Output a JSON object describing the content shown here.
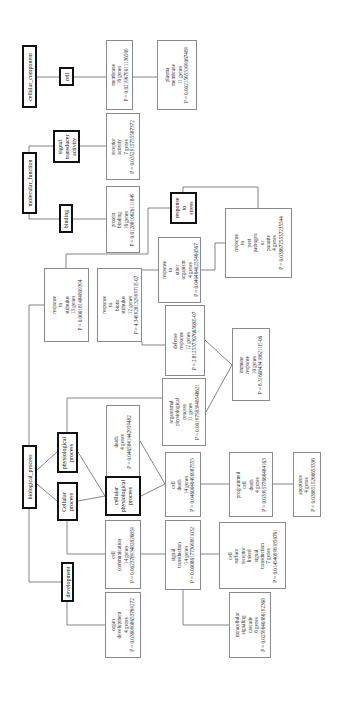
{
  "diagram": {
    "type": "GO term enrichment tree",
    "orientation": "rotated -90deg",
    "nodes": [
      {
        "id": "cellular_component",
        "lines": [
          "cellular_component"
        ],
        "thick": true,
        "box": [
          22,
          45,
          15,
          63
        ]
      },
      {
        "id": "cell",
        "lines": [
          "cell"
        ],
        "thick": true,
        "box": [
          59,
          67,
          15,
          19
        ]
      },
      {
        "id": "membrane",
        "lines": [
          "membrane",
          "16 genes",
          "P = 0.0219679011136509"
        ],
        "thick": false,
        "box": [
          106,
          40,
          27,
          70
        ]
      },
      {
        "id": "plasma_membrane",
        "lines": [
          "plasma",
          "membrane",
          "11 genes",
          "P = 0.00215655169067489"
        ],
        "thick": false,
        "box": [
          157,
          40,
          40,
          70
        ]
      },
      {
        "id": "molecular_function",
        "lines": [
          "molecular_function"
        ],
        "thick": true,
        "box": [
          22,
          152,
          15,
          62
        ]
      },
      {
        "id": "signal_transducer_activity",
        "lines": [
          "signal",
          "transducer",
          "activity"
        ],
        "thick": true,
        "box": [
          53,
          130,
          27,
          33
        ]
      },
      {
        "id": "receptor_activity",
        "lines": [
          "receptor",
          "activity",
          "7 genes",
          "P = 0.0352915755587372"
        ],
        "thick": false,
        "box": [
          106,
          113,
          34,
          67
        ]
      },
      {
        "id": "binding",
        "lines": [
          "binding"
        ],
        "thick": true,
        "box": [
          59,
          204,
          14,
          29
        ]
      },
      {
        "id": "protein_binding",
        "lines": [
          "protein",
          "binding",
          "16 genes",
          "P = 0.0128810620111849"
        ],
        "thick": false,
        "box": [
          106,
          186,
          34,
          67
        ]
      },
      {
        "id": "response_to_stress",
        "lines": [
          "response",
          "to",
          "stress"
        ],
        "thick": true,
        "box": [
          170,
          192,
          27,
          32
        ]
      },
      {
        "id": "response_to_pest",
        "lines": [
          "response",
          "to",
          "pest",
          "pathogen",
          "or",
          "parasite",
          "4 genes",
          "P = 0.0386725537235544"
        ],
        "thick": false,
        "box": [
          225,
          208,
          67,
          70
        ]
      },
      {
        "id": "response_to_other_organism",
        "lines": [
          "response",
          "to",
          "other",
          "organism",
          "4 genes",
          "P = 0.0404640255460567"
        ],
        "thick": false,
        "box": [
          158,
          237,
          43,
          66
        ]
      },
      {
        "id": "response_to_stimulus",
        "lines": [
          "response",
          "to",
          "stimulus",
          "13 genes",
          "P = 0.000181484809394"
        ],
        "thick": false,
        "box": [
          44,
          268,
          45,
          74
        ]
      },
      {
        "id": "response_to_biotic_stimulus",
        "lines": [
          "response",
          "to",
          "biotic",
          "stimulus",
          "12 genes",
          "P = 4.34992813299971E-07"
        ],
        "thick": false,
        "box": [
          97,
          268,
          45,
          74
        ]
      },
      {
        "id": "defense_response",
        "lines": [
          "defense",
          "response",
          "12 genes",
          "P = 2.81253730766568E-07"
        ],
        "thick": false,
        "box": [
          165,
          305,
          40,
          71
        ]
      },
      {
        "id": "immune_response",
        "lines": [
          "immune",
          "response",
          "10 genes",
          "P = 8.31608434186211E-06"
        ],
        "thick": false,
        "box": [
          232,
          328,
          38,
          73
        ]
      },
      {
        "id": "organismal_physiological_process",
        "lines": [
          "organismal",
          "physiological",
          "process",
          "11 genes",
          "P = 0.00197583948548621"
        ],
        "thick": false,
        "box": [
          162,
          378,
          44,
          68
        ]
      },
      {
        "id": "death",
        "lines": [
          "death",
          "4 genes",
          "P = 0.0465841442959482"
        ],
        "thick": false,
        "box": [
          106,
          405,
          34,
          73
        ]
      },
      {
        "id": "physiological_process",
        "lines": [
          "physiological",
          "process"
        ],
        "thick": true,
        "box": [
          57,
          432,
          21,
          41
        ]
      },
      {
        "id": "biological_process",
        "lines": [
          "biological_process"
        ],
        "thick": true,
        "box": [
          22,
          445,
          15,
          64
        ]
      },
      {
        "id": "cellular_process",
        "lines": [
          "Cellular",
          "process"
        ],
        "thick": true,
        "box": [
          57,
          482,
          21,
          39
        ]
      },
      {
        "id": "cellular_physiological_process",
        "lines": [
          "cellular",
          "physiological",
          "process"
        ],
        "thick": true,
        "box": [
          105,
          476,
          36,
          40
        ]
      },
      {
        "id": "cell_death",
        "lines": [
          "cell",
          "death",
          "14 genes",
          "P = 0.0460040490987555"
        ],
        "thick": false,
        "box": [
          165,
          452,
          36,
          65
        ]
      },
      {
        "id": "programmed_cell_death",
        "lines": [
          "programmed",
          "cell",
          "death",
          "4 genes",
          "P = 0.0339577666484163"
        ],
        "thick": false,
        "box": [
          229,
          452,
          44,
          65
        ]
      },
      {
        "id": "apoptosis",
        "lines": [
          "apoptosis",
          "4 genes",
          "P = 0.0388515266653336"
        ],
        "thick": false,
        "box": [
          293,
          452,
          28,
          65
        ]
      },
      {
        "id": "cell_communication",
        "lines": [
          "cell",
          "communication",
          "14 genes",
          "P = 0.00237893482826859"
        ],
        "thick": false,
        "box": [
          105,
          520,
          36,
          69
        ]
      },
      {
        "id": "signal_transduction",
        "lines": [
          "signal",
          "transduction",
          "14 genes",
          "P = 0.00086177309891032"
        ],
        "thick": false,
        "box": [
          165,
          520,
          36,
          70
        ]
      },
      {
        "id": "cell_surface_receptor",
        "lines": [
          "cell",
          "surface",
          "receptor",
          "linked",
          "signal",
          "transduction",
          "7 genes",
          "P = 0.0145409961850761"
        ],
        "thick": false,
        "box": [
          219,
          522,
          67,
          67
        ]
      },
      {
        "id": "development",
        "lines": [
          "development"
        ],
        "thick": true,
        "box": [
          61,
          562,
          13,
          40
        ]
      },
      {
        "id": "organ_development",
        "lines": [
          "organ",
          "development",
          "4 genes",
          "P = 0.0380908653769272"
        ],
        "thick": false,
        "box": [
          105,
          592,
          36,
          66
        ]
      },
      {
        "id": "intracellular_signaling",
        "lines": [
          "intracellular",
          "signaling",
          "cascade",
          "6 genes",
          "P = 0.0259640386192368"
        ],
        "thick": false,
        "box": [
          229,
          592,
          42,
          66
        ]
      }
    ],
    "edges": [
      {
        "points": [
          [
            37,
            77
          ],
          [
            59,
            77
          ]
        ]
      },
      {
        "points": [
          [
            74,
            77
          ],
          [
            106,
            77
          ]
        ]
      },
      {
        "points": [
          [
            133,
            77
          ],
          [
            157,
            77
          ]
        ]
      },
      {
        "points": [
          [
            29,
            152
          ],
          [
            29,
            146
          ],
          [
            53,
            146
          ]
        ]
      },
      {
        "points": [
          [
            29,
            214
          ],
          [
            29,
            219
          ],
          [
            59,
            219
          ]
        ]
      },
      {
        "points": [
          [
            80,
            146
          ],
          [
            106,
            146
          ]
        ]
      },
      {
        "points": [
          [
            73,
            219
          ],
          [
            106,
            219
          ]
        ]
      },
      {
        "points": [
          [
            170,
            208
          ],
          [
            148,
            208
          ],
          [
            148,
            254
          ],
          [
            66,
            254
          ],
          [
            66,
            268
          ]
        ]
      },
      {
        "points": [
          [
            183,
            192
          ],
          [
            183,
            187
          ],
          [
            258,
            187
          ],
          [
            258,
            208
          ]
        ]
      },
      {
        "points": [
          [
            201,
            270
          ],
          [
            215,
            270
          ],
          [
            215,
            243
          ],
          [
            225,
            243
          ]
        ]
      },
      {
        "points": [
          [
            158,
            270
          ],
          [
            117,
            270
          ],
          [
            117,
            268
          ]
        ]
      },
      {
        "points": [
          [
            29,
            445
          ],
          [
            29,
            305
          ],
          [
            44,
            305
          ]
        ]
      },
      {
        "points": [
          [
            142,
            342
          ],
          [
            142,
            345
          ],
          [
            165,
            345
          ]
        ]
      },
      {
        "points": [
          [
            205,
            340
          ],
          [
            232,
            365
          ]
        ]
      },
      {
        "points": [
          [
            206,
            412
          ],
          [
            232,
            365
          ]
        ]
      },
      {
        "points": [
          [
            67,
            432
          ],
          [
            67,
            398
          ],
          [
            162,
            398
          ]
        ]
      },
      {
        "points": [
          [
            37,
            470
          ],
          [
            57,
            452
          ]
        ]
      },
      {
        "points": [
          [
            37,
            484
          ],
          [
            57,
            501
          ]
        ]
      },
      {
        "points": [
          [
            78,
            452
          ],
          [
            105,
            496
          ]
        ]
      },
      {
        "points": [
          [
            78,
            501
          ],
          [
            105,
            496
          ]
        ]
      },
      {
        "points": [
          [
            141,
            496
          ],
          [
            165,
            484
          ]
        ]
      },
      {
        "points": [
          [
            140,
            441
          ],
          [
            165,
            484
          ]
        ]
      },
      {
        "points": [
          [
            201,
            484
          ],
          [
            229,
            484
          ]
        ]
      },
      {
        "points": [
          [
            273,
            484
          ],
          [
            293,
            484
          ]
        ]
      },
      {
        "points": [
          [
            67,
            521
          ],
          [
            67,
            554
          ],
          [
            105,
            554
          ]
        ]
      },
      {
        "points": [
          [
            141,
            554
          ],
          [
            165,
            554
          ]
        ]
      },
      {
        "points": [
          [
            201,
            554
          ],
          [
            219,
            554
          ]
        ]
      },
      {
        "points": [
          [
            183,
            590
          ],
          [
            183,
            625
          ],
          [
            229,
            625
          ]
        ]
      },
      {
        "points": [
          [
            29,
            509
          ],
          [
            29,
            582
          ],
          [
            61,
            582
          ]
        ]
      },
      {
        "points": [
          [
            67,
            602
          ],
          [
            67,
            625
          ],
          [
            105,
            625
          ]
        ]
      }
    ]
  }
}
